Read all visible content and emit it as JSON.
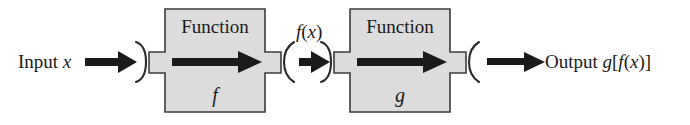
{
  "diagram": {
    "type": "function-composition-flowchart",
    "background_color": "#ffffff",
    "box_fill_color": "#dcdcdc",
    "box_border_color": "#3c3c3c",
    "arrow_color": "#1a1a1a",
    "text_color": "#1a1a1a",
    "input": {
      "label_prefix": "Input ",
      "variable": "x"
    },
    "intermediate": {
      "label": "f(x)",
      "function_part": "f",
      "open_paren": "(",
      "variable": "x",
      "close_paren": ")"
    },
    "output": {
      "label_prefix": "Output ",
      "outer_function": "g",
      "open_bracket": "[",
      "inner_function": "f",
      "open_paren": "(",
      "variable": "x",
      "close_paren": ")",
      "close_bracket": "]"
    },
    "boxes": [
      {
        "id": "function-f",
        "title": "Function",
        "subtitle": "f"
      },
      {
        "id": "function-g",
        "title": "Function",
        "subtitle": "g"
      }
    ],
    "arrows": [
      {
        "id": "arrow-input-to-f",
        "direction": "right"
      },
      {
        "id": "arrow-inside-f",
        "direction": "right"
      },
      {
        "id": "arrow-f-to-g",
        "direction": "right"
      },
      {
        "id": "arrow-inside-g",
        "direction": "right"
      },
      {
        "id": "arrow-g-to-output",
        "direction": "right"
      }
    ]
  }
}
